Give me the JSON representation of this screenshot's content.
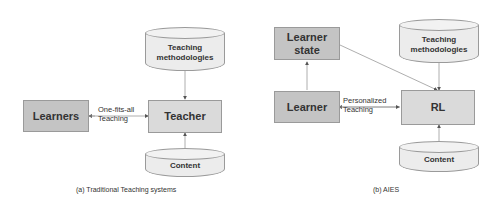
{
  "diagram_a": {
    "nodes": {
      "learners": "Learners",
      "teacher": "Teacher",
      "methodologies_line1": "Teaching",
      "methodologies_line2": "methodologies",
      "content": "Content"
    },
    "edges": {
      "teaching_line1": "One-fits-all",
      "teaching_line2": "Teaching"
    },
    "caption": "(a) Traditional Teaching systems"
  },
  "diagram_b": {
    "nodes": {
      "learner_state_line1": "Learner",
      "learner_state_line2": "state",
      "learner": "Learner",
      "rl": "RL",
      "methodologies_line1": "Teaching",
      "methodologies_line2": "methodologies",
      "content": "Content"
    },
    "edges": {
      "teaching_line1": "Personalized",
      "teaching_line2": "Teaching"
    },
    "caption": "(b) AIES"
  },
  "colors": {
    "node_dark": "#c4c4c4",
    "node_light": "#dadada",
    "cylinder": "#ececec",
    "border": "#9a9a9a"
  }
}
